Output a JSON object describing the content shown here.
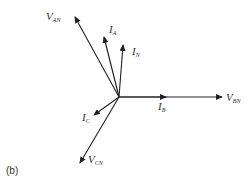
{
  "diagram": {
    "type": "phasor-diagram",
    "caption": "(b)",
    "origin": [
      119,
      97
    ],
    "stroke_color": "#222222",
    "phasors": [
      {
        "id": "V_AN",
        "main": "V",
        "sub": "AN",
        "tip": [
          75,
          17
        ],
        "arrow_at": [
          75,
          17
        ],
        "label_pos": [
          46,
          20
        ]
      },
      {
        "id": "I_A",
        "main": "I",
        "sub": "A",
        "tip": [
          104,
          37
        ],
        "arrow_at": [
          104,
          37
        ],
        "label_pos": [
          109,
          33
        ]
      },
      {
        "id": "I_N",
        "main": "I",
        "sub": "N",
        "tip": [
          123,
          45
        ],
        "arrow_at": [
          123,
          45
        ],
        "label_pos": [
          132,
          55
        ]
      },
      {
        "id": "I_B",
        "main": "I",
        "sub": "B",
        "tip": [
          166,
          97
        ],
        "arrow_at": [
          166,
          97
        ],
        "label_pos": [
          158,
          110
        ]
      },
      {
        "id": "V_BN",
        "main": "V",
        "sub": "BN",
        "tip": [
          222,
          97
        ],
        "arrow_at": [
          222,
          97
        ],
        "label_pos": [
          226,
          101
        ]
      },
      {
        "id": "I_C",
        "main": "I",
        "sub": "C",
        "tip": [
          94,
          115
        ],
        "arrow_at": [
          94,
          115
        ],
        "label_pos": [
          82,
          121
        ]
      },
      {
        "id": "V_CN",
        "main": "V",
        "sub": "CN",
        "tip": [
          80,
          163
        ],
        "arrow_at": [
          80,
          163
        ],
        "label_pos": [
          88,
          163
        ]
      }
    ]
  }
}
